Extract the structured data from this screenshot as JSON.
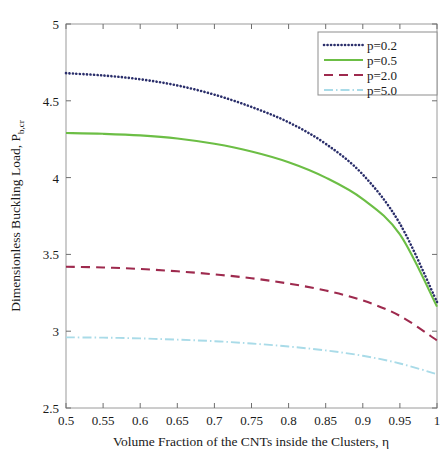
{
  "chart_data": {
    "type": "line",
    "title": "",
    "xlabel": "Volume Fraction of the CNTs inside the Clusters, η",
    "ylabel_main": "Dimensionless Buckling Load, P",
    "ylabel_sub": "b,cr",
    "xlim": [
      0.5,
      1.0
    ],
    "ylim": [
      2.5,
      5.0
    ],
    "xticks": [
      "0.5",
      "0.55",
      "0.6",
      "0.65",
      "0.7",
      "0.75",
      "0.8",
      "0.85",
      "0.9",
      "0.95",
      "1"
    ],
    "xtick_values": [
      0.5,
      0.55,
      0.6,
      0.65,
      0.7,
      0.75,
      0.8,
      0.85,
      0.9,
      0.95,
      1.0
    ],
    "yticks": [
      "2.5",
      "3",
      "3.5",
      "4",
      "4.5",
      "5"
    ],
    "ytick_values": [
      2.5,
      3.0,
      3.5,
      4.0,
      4.5,
      5.0
    ],
    "grid": false,
    "legend_position": "top-right",
    "x": [
      0.5,
      0.55,
      0.6,
      0.65,
      0.7,
      0.75,
      0.8,
      0.85,
      0.9,
      0.95,
      1.0
    ],
    "series": [
      {
        "name": "p=0.2",
        "color": "#2b2f6b",
        "style": "dotted",
        "values": [
          4.68,
          4.665,
          4.64,
          4.6,
          4.54,
          4.46,
          4.36,
          4.22,
          4.02,
          3.7,
          3.19
        ]
      },
      {
        "name": "p=0.5",
        "color": "#6cbe45",
        "style": "solid",
        "values": [
          4.29,
          4.285,
          4.275,
          4.255,
          4.22,
          4.17,
          4.1,
          4.0,
          3.86,
          3.63,
          3.16
        ]
      },
      {
        "name": "p=2.0",
        "color": "#9e2a4e",
        "style": "dashed",
        "values": [
          3.42,
          3.415,
          3.405,
          3.39,
          3.37,
          3.345,
          3.31,
          3.265,
          3.2,
          3.1,
          2.94
        ]
      },
      {
        "name": "p=5.0",
        "color": "#a9dbe8",
        "style": "dashdot",
        "values": [
          2.96,
          2.958,
          2.953,
          2.945,
          2.935,
          2.92,
          2.9,
          2.875,
          2.84,
          2.79,
          2.72
        ]
      }
    ]
  },
  "axes": {
    "x_label_text": "Volume Fraction of the CNTs inside the Clusters, η",
    "y_label_text": "Dimensionless Buckling Load, P",
    "y_label_subscript": "b,cr"
  },
  "legend": {
    "entries": [
      "p=0.2",
      "p=0.5",
      "p=2.0",
      "p=5.0"
    ]
  }
}
